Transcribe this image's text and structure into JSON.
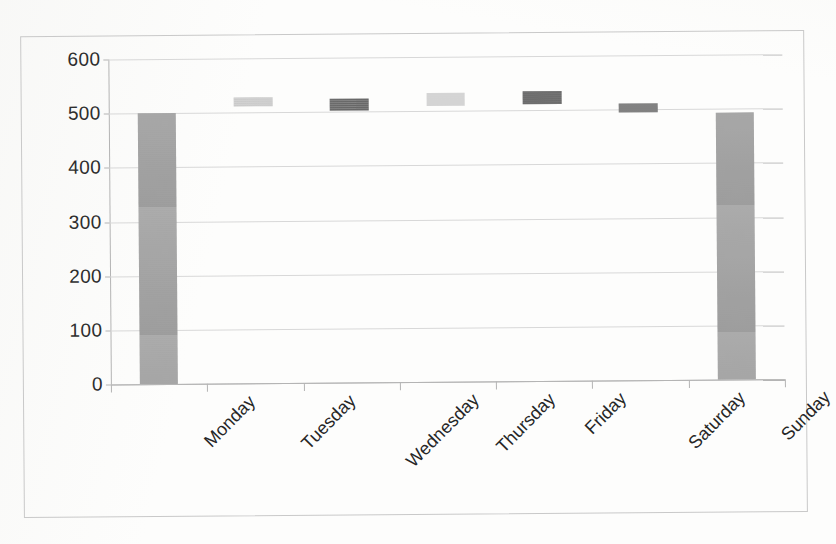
{
  "document": {
    "kind": "scanned-bar-chart",
    "background_color": "#fdfdfc",
    "frame_color": "#c9c9c9"
  },
  "chart_data": {
    "type": "bar",
    "title": "",
    "subtitle": "",
    "xlabel": "",
    "ylabel": "",
    "categories": [
      "Monday",
      "Tuesday",
      "Wednesday",
      "Thursday",
      "Friday",
      "Saturday",
      "Sunday"
    ],
    "values": [
      500,
      528,
      525,
      533,
      535,
      512,
      493
    ],
    "bar_ranges": [
      {
        "category": "Monday",
        "low": 0,
        "high": 500,
        "floating": false,
        "color": "#9b9b9b"
      },
      {
        "category": "Tuesday",
        "low": 512,
        "high": 528,
        "floating": true,
        "color": "#c8c8c8"
      },
      {
        "category": "Wednesday",
        "low": 503,
        "high": 525,
        "floating": true,
        "color": "#5d5d5d"
      },
      {
        "category": "Thursday",
        "low": 510,
        "high": 533,
        "floating": true,
        "color": "#cfcfcf"
      },
      {
        "category": "Friday",
        "low": 512,
        "high": 535,
        "floating": true,
        "color": "#575757"
      },
      {
        "category": "Saturday",
        "low": 495,
        "high": 512,
        "floating": true,
        "color": "#6e6e6e"
      },
      {
        "category": "Sunday",
        "low": 0,
        "high": 493,
        "floating": false,
        "color": "#9b9b9b"
      }
    ],
    "ylim": [
      0,
      600
    ],
    "ytick_values": [
      0,
      100,
      200,
      300,
      400,
      500,
      600
    ],
    "ytick_labels": [
      "0",
      "100",
      "200",
      "300",
      "400",
      "500",
      "600"
    ],
    "ytick_interval": 100,
    "grid": true,
    "grid_axis": "y",
    "grid_color": "#d8d8d8",
    "legend": false,
    "legend_position": "none",
    "axis_line_color": "#b4b4b4",
    "xlabel_rotation_deg": -45
  }
}
